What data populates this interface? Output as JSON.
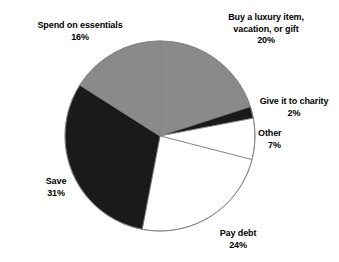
{
  "chart_data": {
    "type": "pie",
    "title": "",
    "subtitle": "",
    "xlabel": "",
    "ylabel": "",
    "legend_position": "none",
    "grid": false,
    "labels_inline": true,
    "unit": "%",
    "categories": [
      "Buy a luxury item, vacation, or gift",
      "Give it to charity",
      "Other",
      "Pay debt",
      "Save",
      "Spend on essentials"
    ],
    "values": [
      20,
      2,
      7,
      24,
      31,
      16
    ],
    "start_angle_deg": 0,
    "direction": "clockwise",
    "slices": [
      {
        "name": "Buy a luxury item, vacation, or gift",
        "value": 20,
        "value_text": "20%",
        "color": "#8a8a8a",
        "label_lines": [
          "Buy a luxury item,",
          "vacation, or gift"
        ]
      },
      {
        "name": "Give it to charity",
        "value": 2,
        "value_text": "2%",
        "color": "#1a1a1a",
        "label_lines": [
          "Give it to charity"
        ]
      },
      {
        "name": "Other",
        "value": 7,
        "value_text": "7%",
        "color": "#ffffff",
        "label_lines": [
          "Other"
        ]
      },
      {
        "name": "Pay debt",
        "value": 24,
        "value_text": "24%",
        "color": "#ffffff",
        "label_lines": [
          "Pay debt"
        ]
      },
      {
        "name": "Save",
        "value": 31,
        "value_text": "31%",
        "color": "#1a1a1a",
        "label_lines": [
          "Save"
        ]
      },
      {
        "name": "Spend on essentials",
        "value": 16,
        "value_text": "16%",
        "color": "#8a8a8a",
        "label_lines": [
          "Spend on essentials"
        ]
      }
    ]
  },
  "labels": {
    "spend": {
      "line1": "Spend on essentials",
      "pct": "16%"
    },
    "luxury": {
      "line1": "Buy a luxury item,",
      "line2": "vacation, or gift",
      "pct": "20%"
    },
    "charity": {
      "line1": "Give it to charity",
      "pct": "2%"
    },
    "other": {
      "line1": "Other",
      "pct": "7%"
    },
    "paydebt": {
      "line1": "Pay debt",
      "pct": "24%"
    },
    "save": {
      "line1": "Save",
      "pct": "31%"
    }
  },
  "geometry": {
    "center_x": 160,
    "center_y": 136,
    "radius": 95
  },
  "colors": {
    "gray": "#8a8a8a",
    "dark": "#1a1a1a",
    "white": "#ffffff",
    "outline": "#808080",
    "background": "#ffffff",
    "text": "#000000"
  }
}
